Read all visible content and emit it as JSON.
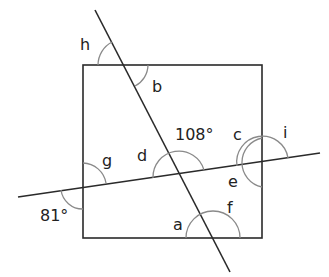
{
  "diagram": {
    "type": "geometry-angles",
    "colors": {
      "lines": "#2a2a2a",
      "arcs": "#8a8a8a",
      "text": "#222222",
      "background": "#ffffff"
    },
    "labels": {
      "h": "h",
      "b": "b",
      "g": "g",
      "d": "d",
      "given_top": "108°",
      "c": "c",
      "i": "i",
      "e": "e",
      "given_left": "81°",
      "a": "a",
      "f": "f"
    },
    "given_angles": [
      {
        "label": "108°",
        "value": 108,
        "location": "above transversal, right of diagonal at their intersection"
      },
      {
        "label": "81°",
        "value": 81,
        "location": "below transversal, left of rectangle's left side"
      }
    ],
    "unknown_angles": [
      "a",
      "b",
      "c",
      "d",
      "e",
      "f",
      "g",
      "h",
      "i"
    ]
  }
}
